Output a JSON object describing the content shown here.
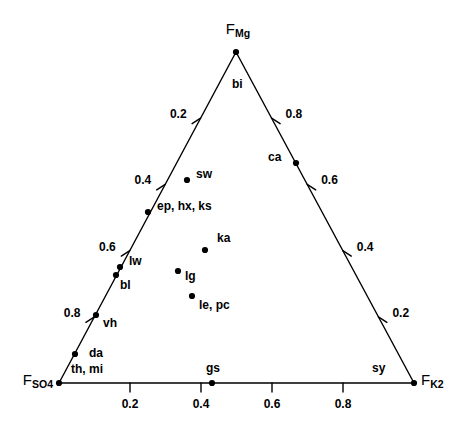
{
  "chart_data": {
    "type": "scatter",
    "title": "",
    "subtitle": "",
    "plot_kind": "ternary-diagram",
    "axes": {
      "top": {
        "name": "F_Mg",
        "label_text": "F",
        "label_sub": "Mg"
      },
      "bottom_left": {
        "name": "F_SO4",
        "label_text": "F",
        "label_sub": "SO4"
      },
      "bottom_right": {
        "name": "F_K2",
        "label_text": "F",
        "label_sub": "K2"
      }
    },
    "tick_values": [
      0.2,
      0.4,
      0.6,
      0.8
    ],
    "left_axis_ticks": [
      "0.2",
      "0.4",
      "0.6",
      "0.8"
    ],
    "right_axis_ticks": [
      "0.8",
      "0.6",
      "0.4",
      "0.2"
    ],
    "bottom_axis_ticks": [
      "0.2",
      "0.4",
      "0.6",
      "0.8"
    ],
    "grid": false,
    "legend": "none",
    "points": [
      {
        "label": "bi",
        "x": 236,
        "y": 52,
        "on_vertex": true,
        "label_dx": -4,
        "label_dy": 32
      },
      {
        "label": "sw",
        "x": 187,
        "y": 180,
        "on_vertex": false,
        "label_dx": 9,
        "label_dy": -6
      },
      {
        "label": "ca",
        "x": 296,
        "y": 163,
        "on_vertex": false,
        "label_dx": -28,
        "label_dy": -6
      },
      {
        "label": "ep, hx, ks",
        "x": 148,
        "y": 212,
        "on_vertex": false,
        "label_dx": 9,
        "label_dy": -6
      },
      {
        "label": "ka",
        "x": 205,
        "y": 250,
        "on_vertex": false,
        "label_dx": 12,
        "label_dy": -12
      },
      {
        "label": "lw",
        "x": 120,
        "y": 267,
        "on_vertex": false,
        "label_dx": 9,
        "label_dy": -6
      },
      {
        "label": "lg",
        "x": 178,
        "y": 271,
        "on_vertex": false,
        "label_dx": 7,
        "label_dy": 5
      },
      {
        "label": "bl",
        "x": 116,
        "y": 275,
        "on_vertex": false,
        "label_dx": 4,
        "label_dy": 10
      },
      {
        "label": "le, pc",
        "x": 192,
        "y": 296,
        "on_vertex": false,
        "label_dx": 7,
        "label_dy": 9
      },
      {
        "label": "vh",
        "x": 96,
        "y": 315,
        "on_vertex": false,
        "label_dx": 7,
        "label_dy": 8
      },
      {
        "label": "da",
        "x": 75,
        "y": 354,
        "on_vertex": false,
        "label_dx": 14,
        "label_dy": -1
      },
      {
        "label": "th, mi",
        "x": 59,
        "y": 383,
        "on_vertex": true,
        "label_dx": 12,
        "label_dy": -14
      },
      {
        "label": "gs",
        "x": 212,
        "y": 383,
        "on_vertex": false,
        "label_dx": -6,
        "label_dy": -15
      },
      {
        "label": "sy",
        "x": 414,
        "y": 383,
        "on_vertex": true,
        "label_dx": -42,
        "label_dy": -15
      }
    ]
  },
  "geometry": {
    "apex": {
      "x": 236,
      "y": 52
    },
    "bottom_left": {
      "x": 59,
      "y": 383
    },
    "bottom_right": {
      "x": 414,
      "y": 383
    }
  },
  "colors": {
    "line": "#000000",
    "point": "#000000",
    "text": "#000000",
    "background": "#ffffff"
  }
}
